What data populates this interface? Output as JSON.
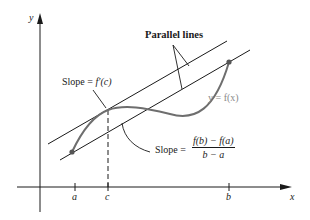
{
  "diagram": {
    "type": "mean-value-theorem-illustration",
    "axes": {
      "x_label": "x",
      "y_label": "y"
    },
    "ticks": [
      {
        "label": "a",
        "x": 75
      },
      {
        "label": "c",
        "x": 108
      },
      {
        "label": "b",
        "x": 229
      }
    ],
    "labels": {
      "parallel_lines": "Parallel lines",
      "tangent_slope_prefix": "Slope = ",
      "tangent_slope_expr": "f′(c)",
      "curve_label": "y = f(x)",
      "secant_slope_prefix": "Slope = ",
      "secant_numerator": "f(b) − f(a)",
      "secant_denominator": "b − a"
    },
    "colors": {
      "ink": "#1a1a1a",
      "curve": "#6e6e6e",
      "curve_label": "#8a8a8a"
    }
  }
}
